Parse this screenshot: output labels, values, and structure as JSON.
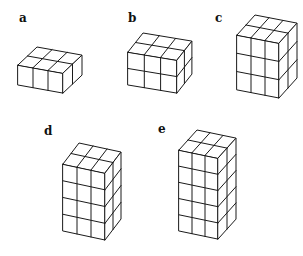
{
  "figure": {
    "line_color": "#1a1a1a",
    "background": "#ffffff"
  },
  "shapes": [
    {
      "label": "a",
      "cols": 3,
      "depth": 2,
      "rows": 1,
      "label_pos": [
        19,
        12
      ],
      "origin": [
        18,
        65
      ],
      "w": [
        15,
        2.7
      ],
      "d": [
        9.5,
        -9
      ],
      "h": 20
    },
    {
      "label": "b",
      "cols": 3,
      "depth": 2,
      "rows": 2,
      "label_pos": [
        128,
        12
      ],
      "origin": [
        128,
        52
      ],
      "w": [
        16.3,
        2.7
      ],
      "d": [
        7.5,
        -9.5
      ],
      "h": 16.5
    },
    {
      "label": "c",
      "cols": 3,
      "depth": 2,
      "rows": 3,
      "label_pos": [
        215,
        12
      ],
      "origin": [
        237,
        35
      ],
      "w": [
        14,
        2.7
      ],
      "d": [
        9,
        -10
      ],
      "h": 18.3
    },
    {
      "label": "d",
      "cols": 3,
      "depth": 2,
      "rows": 4,
      "label_pos": [
        44,
        125
      ],
      "origin": [
        63,
        164
      ],
      "w": [
        14,
        3
      ],
      "d": [
        8,
        -10.5
      ],
      "h": 16.75
    },
    {
      "label": "e",
      "cols": 3,
      "depth": 2,
      "rows": 5,
      "label_pos": [
        158,
        123
      ],
      "origin": [
        179,
        150
      ],
      "w": [
        13,
        2.7
      ],
      "d": [
        9,
        -10
      ],
      "h": 16.2
    }
  ]
}
